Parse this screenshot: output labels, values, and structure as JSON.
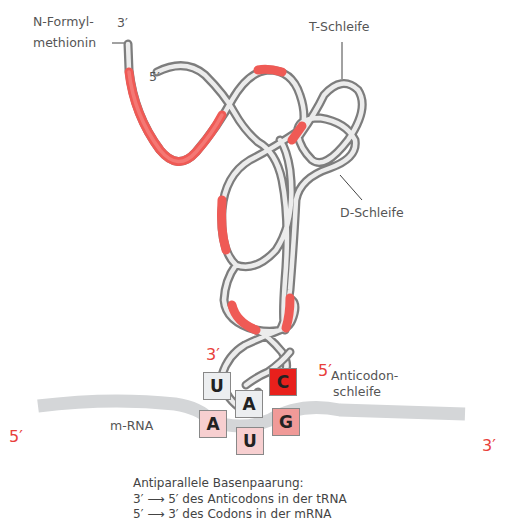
{
  "labels": {
    "n_formyl_line1": "N-Formyl-",
    "n_formyl_line2": "methionin",
    "t_loop": "T-Schleife",
    "d_loop": "D-Schleife",
    "anticodon_line1": "Anticodon-",
    "anticodon_line2": "schleife",
    "mrna": "m-RNA"
  },
  "ends": {
    "trna_3_top": "3′",
    "trna_5_top": "5′",
    "anticodon_3": "3′",
    "anticodon_5": "5′",
    "mrna_5": "5′",
    "mrna_3": "3′"
  },
  "anticodon": [
    {
      "base": "U",
      "color": "#eceef0"
    },
    {
      "base": "A",
      "color": "#eceef0"
    },
    {
      "base": "C",
      "color": "#e8201c"
    }
  ],
  "codon": [
    {
      "base": "A",
      "color": "#f7cfd0"
    },
    {
      "base": "U",
      "color": "#f7cfd0"
    },
    {
      "base": "G",
      "color": "#f09a98"
    }
  ],
  "caption": {
    "title": "Antiparallele Basenpaarung:",
    "line1": "3′ ⟶ 5′ des Anticodons in der tRNA",
    "line2": "5′ ⟶ 3′ des Codons in der mRNA"
  },
  "colors": {
    "strand_gray": "#8a8a8a",
    "strand_highlight": "#e9e9e9",
    "strand_red": "#ef5a55",
    "mrna_gray": "#d4d6d8",
    "prime_red": "#e8403a"
  }
}
